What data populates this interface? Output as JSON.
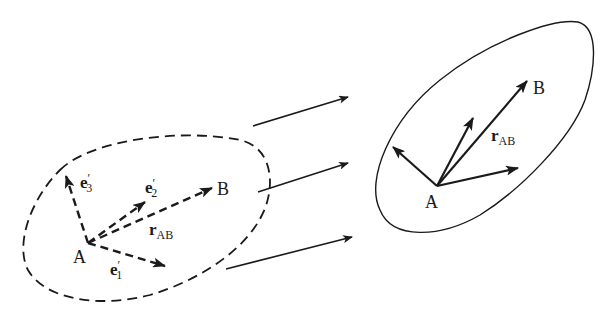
{
  "figure": {
    "left_body": {
      "style": "dashed",
      "point_A": "A",
      "point_B": "B",
      "vectors": {
        "e1": {
          "base": "e",
          "prime": "′",
          "sub": "1"
        },
        "e2": {
          "base": "e",
          "prime": "′",
          "sub": "2"
        },
        "e3": {
          "base": "e",
          "prime": "′",
          "sub": "3"
        },
        "rAB": {
          "base": "r",
          "sub": "AB"
        }
      }
    },
    "right_body": {
      "style": "solid",
      "point_A": "A",
      "point_B": "B",
      "vectors": {
        "rAB": {
          "base": "r",
          "sub": "AB"
        }
      }
    },
    "mapping_arrows": 3,
    "colors": {
      "ink": "#1a1a1a",
      "background": "#ffffff"
    }
  }
}
